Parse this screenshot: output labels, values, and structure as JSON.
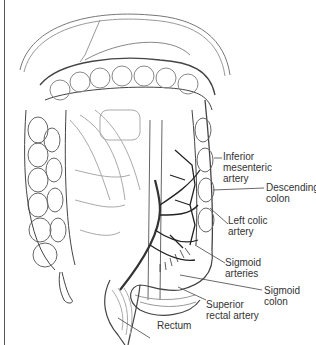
{
  "figure": {
    "labels": [
      {
        "id": "inferior-mesenteric-artery",
        "text": "Inferior\nmesenteric\nartery"
      },
      {
        "id": "descending-colon",
        "text": "Descending\ncolon"
      },
      {
        "id": "left-colic-artery",
        "text": "Left colic\nartery"
      },
      {
        "id": "sigmoid-arteries",
        "text": "Sigmoid\narteries"
      },
      {
        "id": "sigmoid-colon",
        "text": "Sigmoid\ncolon"
      },
      {
        "id": "superior-rectal-artery",
        "text": "Superior\nrectal artery"
      },
      {
        "id": "rectum",
        "text": "Rectum"
      }
    ]
  }
}
